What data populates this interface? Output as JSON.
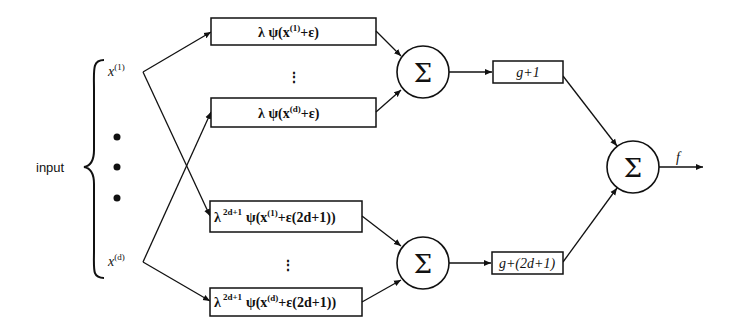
{
  "diagram": {
    "input_label": "input",
    "inputs": [
      {
        "base": "x",
        "sup": "(1)"
      },
      {
        "base": "x",
        "sup": "(d)"
      }
    ],
    "input_ellipsis": "•",
    "inner_boxes_group1": [
      {
        "text_pre": "λ ψ(x",
        "sup": "(1)",
        "text_post": "+ε)"
      },
      {
        "text_pre": "λ ψ(x",
        "sup": "(d)",
        "text_post": "+ε)"
      }
    ],
    "inner_boxes_group2": [
      {
        "lambda": "λ",
        "lambda_sup": "2d+1",
        "text_pre": "ψ(x",
        "sup": "(1)",
        "text_post": "+ε(2d+1))"
      },
      {
        "lambda": "λ",
        "lambda_sup": "2d+1",
        "text_pre": "ψ(x",
        "sup": "(d)",
        "text_post": "+ε(2d+1))"
      }
    ],
    "vertical_ellipsis": "⋮",
    "sum_symbol": "Σ",
    "outer_boxes": [
      {
        "label": "g+1"
      },
      {
        "label": "g+(2d+1)"
      }
    ],
    "output_label": "f"
  }
}
